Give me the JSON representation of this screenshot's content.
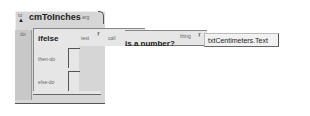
{
  "procedure": {
    "collapse_marker": "to",
    "name": "cmToInches",
    "arg_label": "arg",
    "do_label": "do"
  },
  "ifelse": {
    "name": "ifelse",
    "test_label": "test",
    "then_label": "then-do",
    "else_label": "else-do"
  },
  "call": {
    "call_label": "call",
    "function_name": "is a number?",
    "arg_label": "thing"
  },
  "thing_value": {
    "text": "txtCentimeters.Text"
  },
  "colors": {
    "procedure_bg": "#d6d6d6",
    "block_bg": "#e6e6e6",
    "value_bg": "#f1f1f1",
    "outline": "#555555"
  }
}
